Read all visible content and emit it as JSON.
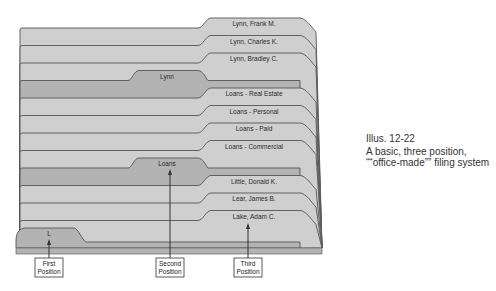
{
  "figure": {
    "number": "Illus. 12-22",
    "caption": "A basic, three position, ““office-made”” filing system"
  },
  "colors": {
    "folder_fill": "#cfcfcf",
    "guide_fill": "#b3b3b3",
    "outline": "#555555",
    "background": "#ffffff"
  },
  "folders": [
    {
      "label": "Lynn, Frank M.",
      "position": "third",
      "type": "folder"
    },
    {
      "label": "Lynn, Charles K.",
      "position": "third",
      "type": "folder"
    },
    {
      "label": "Lynn, Bradley C.",
      "position": "third",
      "type": "folder"
    },
    {
      "label": "Lynn",
      "position": "second",
      "type": "guide"
    },
    {
      "label": "Loans - Real Estate",
      "position": "third",
      "type": "folder"
    },
    {
      "label": "Loans - Personal",
      "position": "third",
      "type": "folder"
    },
    {
      "label": "Loans - Paid",
      "position": "third",
      "type": "folder"
    },
    {
      "label": "Loans - Commercial",
      "position": "third",
      "type": "folder"
    },
    {
      "label": "Loans",
      "position": "second",
      "type": "guide"
    },
    {
      "label": "Little, Donald K.",
      "position": "third",
      "type": "folder"
    },
    {
      "label": "Lear, James B.",
      "position": "third",
      "type": "folder"
    },
    {
      "label": "Lake, Adam C.",
      "position": "third",
      "type": "folder"
    },
    {
      "label": "L",
      "position": "first",
      "type": "guide"
    }
  ],
  "positions": [
    {
      "label_line1": "First",
      "label_line2": "Position"
    },
    {
      "label_line1": "Second",
      "label_line2": "Position"
    },
    {
      "label_line1": "Third",
      "label_line2": "Position"
    }
  ]
}
